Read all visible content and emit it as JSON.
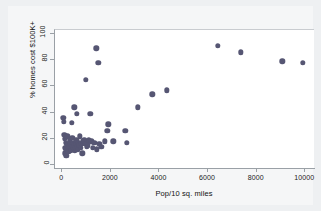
{
  "chart_data": {
    "type": "scatter",
    "title": "",
    "xlabel": "Pop/10 sq. miles",
    "ylabel": "% homes cost $100K+",
    "xlim": [
      -300,
      10400
    ],
    "ylim": [
      -3,
      103
    ],
    "xticks": [
      0,
      2000,
      4000,
      6000,
      8000,
      10000
    ],
    "xtick_labels": [
      "0",
      "2000",
      "4000",
      "6000",
      "8000",
      "10000"
    ],
    "yticks": [
      0,
      20,
      40,
      60,
      80,
      100
    ],
    "ytick_labels": [
      "0",
      "20",
      "40",
      "60",
      "80",
      "100"
    ],
    "grid": false,
    "legend": false,
    "marker_color": "#565673",
    "marker_size": 5.4,
    "points": [
      [
        40,
        36
      ],
      [
        70,
        33
      ],
      [
        90,
        23
      ],
      [
        110,
        20
      ],
      [
        120,
        13
      ],
      [
        130,
        9
      ],
      [
        150,
        17
      ],
      [
        160,
        12
      ],
      [
        170,
        7
      ],
      [
        200,
        22
      ],
      [
        210,
        15
      ],
      [
        230,
        13
      ],
      [
        250,
        10
      ],
      [
        270,
        14
      ],
      [
        300,
        19
      ],
      [
        320,
        16
      ],
      [
        340,
        12
      ],
      [
        360,
        11
      ],
      [
        380,
        14
      ],
      [
        400,
        32
      ],
      [
        420,
        21
      ],
      [
        440,
        17
      ],
      [
        460,
        13
      ],
      [
        480,
        15
      ],
      [
        500,
        44
      ],
      [
        520,
        11
      ],
      [
        540,
        13
      ],
      [
        560,
        16
      ],
      [
        580,
        19
      ],
      [
        600,
        39
      ],
      [
        620,
        14
      ],
      [
        640,
        12
      ],
      [
        660,
        17
      ],
      [
        700,
        15
      ],
      [
        720,
        22
      ],
      [
        760,
        13
      ],
      [
        790,
        16
      ],
      [
        820,
        9
      ],
      [
        860,
        18
      ],
      [
        900,
        19
      ],
      [
        940,
        16
      ],
      [
        980,
        65
      ],
      [
        1020,
        14
      ],
      [
        1060,
        15
      ],
      [
        1100,
        19
      ],
      [
        1150,
        39
      ],
      [
        1200,
        18
      ],
      [
        1260,
        13
      ],
      [
        1320,
        17
      ],
      [
        1400,
        89
      ],
      [
        1420,
        12
      ],
      [
        1480,
        78
      ],
      [
        1520,
        16
      ],
      [
        1600,
        14
      ],
      [
        1750,
        18
      ],
      [
        1850,
        26
      ],
      [
        1900,
        31
      ],
      [
        2100,
        18
      ],
      [
        2600,
        26
      ],
      [
        2650,
        17
      ],
      [
        3100,
        44
      ],
      [
        3700,
        54
      ],
      [
        4300,
        57
      ],
      [
        6400,
        91
      ],
      [
        7350,
        86
      ],
      [
        9050,
        79
      ],
      [
        9900,
        78
      ]
    ]
  }
}
